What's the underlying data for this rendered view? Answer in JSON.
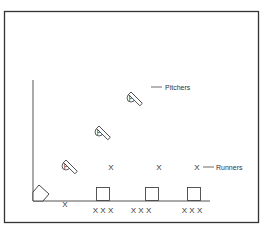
{
  "diagram": {
    "labels": {
      "pitchers": "Pitchers",
      "runners": "Runners"
    },
    "pitcher_symbol": "P",
    "pitchers": [
      {
        "cx": 66,
        "cy": 166
      },
      {
        "cx": 99,
        "cy": 132
      },
      {
        "cx": 131,
        "cy": 98
      }
    ],
    "runners_top": [
      "X",
      "X",
      "X"
    ],
    "catcher_marker": "X",
    "base_groups": [
      "X X X",
      "X X X",
      "X X X"
    ],
    "colors": {
      "line": "#444444",
      "border": "#333333",
      "background": "#ffffff"
    }
  }
}
